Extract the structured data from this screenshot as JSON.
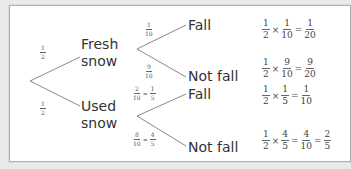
{
  "diagram": {
    "type": "tree",
    "first_level": [
      {
        "label_line1": "Fresh",
        "label_line2": "snow",
        "prob": {
          "n": "1",
          "d": "2"
        },
        "branches": [
          {
            "label": "Fall",
            "prob": {
              "n": "1",
              "d": "10"
            },
            "result": {
              "a": {
                "n": "1",
                "d": "2"
              },
              "op": "×",
              "b": {
                "n": "1",
                "d": "10"
              },
              "eq": "=",
              "c": {
                "n": "1",
                "d": "20"
              }
            }
          },
          {
            "label": "Not fall",
            "prob": {
              "n": "9",
              "d": "10"
            },
            "result": {
              "a": {
                "n": "1",
                "d": "2"
              },
              "op": "×",
              "b": {
                "n": "9",
                "d": "10"
              },
              "eq": "=",
              "c": {
                "n": "9",
                "d": "20"
              }
            }
          }
        ]
      },
      {
        "label_line1": "Used",
        "label_line2": "snow",
        "prob": {
          "n": "1",
          "d": "2"
        },
        "branches": [
          {
            "label": "Fall",
            "prob": {
              "n": "2",
              "d": "10",
              "eq": "=",
              "n2": "1",
              "d2": "5"
            },
            "result": {
              "a": {
                "n": "1",
                "d": "2"
              },
              "op": "×",
              "b": {
                "n": "1",
                "d": "5"
              },
              "eq": "=",
              "c": {
                "n": "1",
                "d": "10"
              }
            }
          },
          {
            "label": "Not fall",
            "prob": {
              "n": "8",
              "d": "10",
              "eq": "=",
              "n2": "4",
              "d2": "5"
            },
            "result": {
              "a": {
                "n": "1",
                "d": "2"
              },
              "op": "×",
              "b": {
                "n": "4",
                "d": "5"
              },
              "eq": "=",
              "c": {
                "n": "4",
                "d": "10"
              },
              "eq2": "=",
              "e": {
                "n": "2",
                "d": "5"
              }
            }
          }
        ]
      }
    ]
  }
}
